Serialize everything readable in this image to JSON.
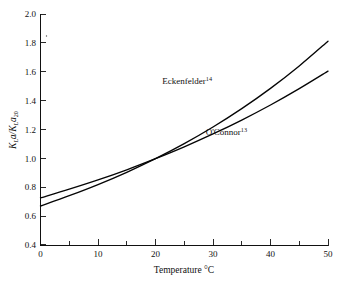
{
  "chart_data": {
    "type": "line",
    "title": "",
    "subtitle": "",
    "xlabel": "Temperature °C",
    "ylabel": "K_L a / K_L a_20",
    "ylabel_parts": {
      "main1": "K",
      "sub1": "L",
      "main2": "a/K",
      "sub2": "L",
      "main3": "a",
      "sub3": "20"
    },
    "xlim": [
      0,
      50
    ],
    "ylim": [
      0.4,
      2.0
    ],
    "x_major_ticks": [
      0,
      10,
      20,
      30,
      40,
      50
    ],
    "x_minor_ticks": [
      5,
      15,
      25,
      35,
      45
    ],
    "x_tick_labels": [
      "0",
      "10",
      "20",
      "30",
      "40",
      "50"
    ],
    "y_major_ticks": [
      0.4,
      0.6,
      0.8,
      1.0,
      1.2,
      1.4,
      1.6,
      1.8,
      2.0
    ],
    "y_tick_labels": [
      "0.4",
      "0.6",
      "0.8",
      "1.0",
      "1.2",
      "1.4",
      "1.6",
      "1.8",
      "2.0"
    ],
    "grid": false,
    "legend_position": "inline-annotations",
    "normalization_point": {
      "x": 20,
      "y": 1.0
    },
    "series": [
      {
        "name": "Eckenfelder",
        "reference_superscript": "14",
        "theta": 1.02,
        "color": "#050505",
        "x": [
          0,
          5,
          10,
          15,
          20,
          25,
          30,
          35,
          40,
          45,
          50
        ],
        "values": [
          0.673,
          0.744,
          0.821,
          0.906,
          1.0,
          1.104,
          1.219,
          1.346,
          1.486,
          1.641,
          1.812
        ]
      },
      {
        "name": "O'Connor",
        "reference_superscript": "13",
        "theta": 1.0159,
        "color": "#050505",
        "x": [
          0,
          5,
          10,
          15,
          20,
          25,
          30,
          35,
          40,
          45,
          50
        ],
        "values": [
          0.729,
          0.789,
          0.853,
          0.923,
          1.0,
          1.082,
          1.171,
          1.267,
          1.371,
          1.484,
          1.605
        ]
      }
    ],
    "annotations": [
      {
        "name": "eckenfelder-label",
        "text": "Eckenfelder",
        "superscript": "14",
        "x_px": 212,
        "y_px": 84
      },
      {
        "name": "oconnor-label",
        "text": "O'Connor",
        "superscript": "13",
        "x_px": 247,
        "y_px": 135
      }
    ]
  }
}
